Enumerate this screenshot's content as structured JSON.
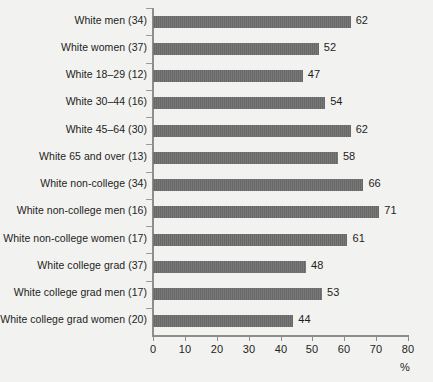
{
  "chart_data": {
    "type": "bar",
    "orientation": "horizontal",
    "title": "",
    "xlabel": "%",
    "ylabel": "",
    "xlim": [
      0,
      80
    ],
    "xticks": [
      0,
      10,
      20,
      30,
      40,
      50,
      60,
      70,
      80
    ],
    "grid": false,
    "legend": false,
    "bar_color": "#6e6e6e",
    "background_color": "#f2f2f0",
    "text_color": "#1d1d1b",
    "axis_color": "#8d8d8a",
    "categories": [
      "White men (34)",
      "White women (37)",
      "White 18–29 (12)",
      "White 30–44 (16)",
      "White 45–64 (30)",
      "White 65 and over (13)",
      "White non-college (34)",
      "White non-college men (16)",
      "White non-college women (17)",
      "White college grad (37)",
      "White college grad men (17)",
      "White college grad women (20)"
    ],
    "values": [
      62,
      52,
      47,
      54,
      62,
      58,
      66,
      71,
      61,
      48,
      53,
      44
    ],
    "value_labels": [
      "62",
      "52",
      "47",
      "54",
      "62",
      "58",
      "66",
      "71",
      "61",
      "48",
      "53",
      "44"
    ]
  }
}
